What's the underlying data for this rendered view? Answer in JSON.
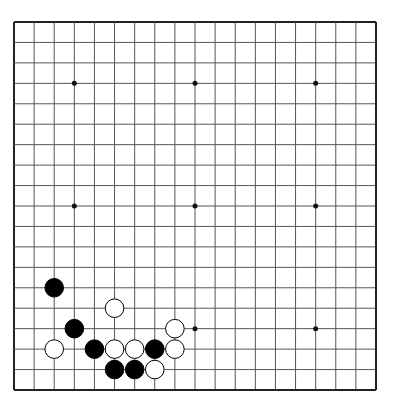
{
  "board": {
    "size": 19,
    "origin": {
      "x": 14,
      "y": 22
    },
    "end": {
      "x": 376,
      "y": 390
    },
    "background": "#ffffff",
    "line_color": "#555555",
    "border_color": "#222222",
    "star_points": [
      [
        3,
        3
      ],
      [
        9,
        3
      ],
      [
        15,
        3
      ],
      [
        3,
        9
      ],
      [
        9,
        9
      ],
      [
        15,
        9
      ],
      [
        9,
        15
      ],
      [
        15,
        15
      ]
    ],
    "stones": [
      {
        "color": "black",
        "col": 2,
        "row": 13
      },
      {
        "color": "white",
        "col": 5,
        "row": 14
      },
      {
        "color": "black",
        "col": 3,
        "row": 15
      },
      {
        "color": "white",
        "col": 8,
        "row": 15
      },
      {
        "color": "white",
        "col": 2,
        "row": 16
      },
      {
        "color": "black",
        "col": 4,
        "row": 16
      },
      {
        "color": "white",
        "col": 5,
        "row": 16
      },
      {
        "color": "white",
        "col": 6,
        "row": 16
      },
      {
        "color": "black",
        "col": 7,
        "row": 16
      },
      {
        "color": "white",
        "col": 8,
        "row": 16
      },
      {
        "color": "black",
        "col": 5,
        "row": 17
      },
      {
        "color": "black",
        "col": 6,
        "row": 17
      },
      {
        "color": "white",
        "col": 7,
        "row": 17
      }
    ]
  }
}
